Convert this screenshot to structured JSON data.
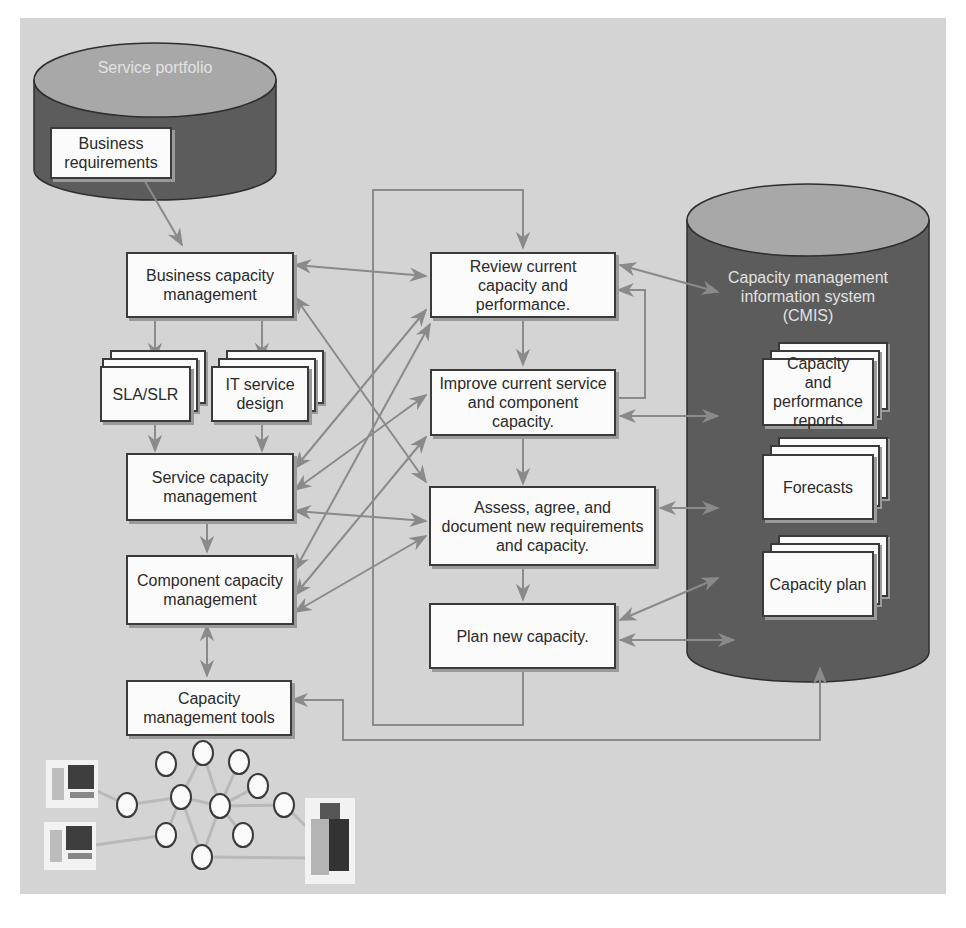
{
  "diagram": {
    "type": "process-flow",
    "colors": {
      "panel_background": "#d4d4d4",
      "cylinder_body": "#5c5c5c",
      "cylinder_top": "#a8a8a8",
      "box_fill": "#fbfbfb",
      "box_border": "#3a3a3a",
      "arrow": "#8a8a8a",
      "cylinder_label": "#e2e2e2"
    },
    "service_portfolio": {
      "label": "Service portfolio",
      "items": [
        {
          "id": "business_requirements",
          "label": "Business requirements"
        }
      ]
    },
    "left_column": [
      {
        "id": "business_capacity_management",
        "label": "Business capacity management"
      },
      {
        "id": "sla_slr",
        "label": "SLA/SLR",
        "stacked": true
      },
      {
        "id": "it_service_design",
        "label": "IT service design",
        "stacked": true
      },
      {
        "id": "service_capacity_management",
        "label": "Service capacity management"
      },
      {
        "id": "component_capacity_management",
        "label": "Component capacity management"
      },
      {
        "id": "capacity_management_tools",
        "label": "Capacity management tools"
      }
    ],
    "process_steps": [
      {
        "id": "review",
        "label": "Review current capacity and performance."
      },
      {
        "id": "improve",
        "label": "Improve current service and component capacity."
      },
      {
        "id": "assess",
        "label": "Assess, agree, and document new requirements and capacity."
      },
      {
        "id": "plan",
        "label": "Plan new capacity."
      }
    ],
    "cmis": {
      "label": "Capacity management information system (CMIS)",
      "documents": [
        {
          "id": "capacity_performance_reports",
          "label": "Capacity and performance reports"
        },
        {
          "id": "forecasts",
          "label": "Forecasts"
        },
        {
          "id": "capacity_plan",
          "label": "Capacity plan"
        }
      ]
    },
    "infrastructure": {
      "workstations": 2,
      "servers": 1,
      "network_nodes": 11
    },
    "edges": [
      {
        "from": "business_requirements",
        "to": "business_capacity_management",
        "dir": "forward"
      },
      {
        "from": "business_capacity_management",
        "to": "sla_slr",
        "dir": "forward"
      },
      {
        "from": "business_capacity_management",
        "to": "it_service_design",
        "dir": "forward"
      },
      {
        "from": "sla_slr",
        "to": "service_capacity_management",
        "dir": "forward"
      },
      {
        "from": "it_service_design",
        "to": "service_capacity_management",
        "dir": "forward"
      },
      {
        "from": "service_capacity_management",
        "to": "component_capacity_management",
        "dir": "forward"
      },
      {
        "from": "component_capacity_management",
        "to": "capacity_management_tools",
        "dir": "both"
      },
      {
        "from": "business_capacity_management",
        "to": "review",
        "dir": "both"
      },
      {
        "from": "business_capacity_management",
        "to": "assess",
        "dir": "both"
      },
      {
        "from": "service_capacity_management",
        "to": "review",
        "dir": "both"
      },
      {
        "from": "service_capacity_management",
        "to": "improve",
        "dir": "both"
      },
      {
        "from": "service_capacity_management",
        "to": "assess",
        "dir": "both"
      },
      {
        "from": "component_capacity_management",
        "to": "review",
        "dir": "both"
      },
      {
        "from": "component_capacity_management",
        "to": "improve",
        "dir": "both"
      },
      {
        "from": "component_capacity_management",
        "to": "assess",
        "dir": "both"
      },
      {
        "from": "review",
        "to": "improve",
        "dir": "forward"
      },
      {
        "from": "improve",
        "to": "review",
        "dir": "forward"
      },
      {
        "from": "improve",
        "to": "assess",
        "dir": "forward"
      },
      {
        "from": "assess",
        "to": "plan",
        "dir": "forward"
      },
      {
        "from": "plan",
        "to": "review",
        "dir": "forward",
        "note": "loop"
      },
      {
        "from": "review",
        "to": "cmis",
        "dir": "both"
      },
      {
        "from": "improve",
        "to": "cmis",
        "dir": "both"
      },
      {
        "from": "assess",
        "to": "cmis",
        "dir": "both"
      },
      {
        "from": "plan",
        "to": "cmis",
        "dir": "both"
      },
      {
        "from": "capacity_management_tools",
        "to": "cmis",
        "dir": "both"
      }
    ]
  }
}
